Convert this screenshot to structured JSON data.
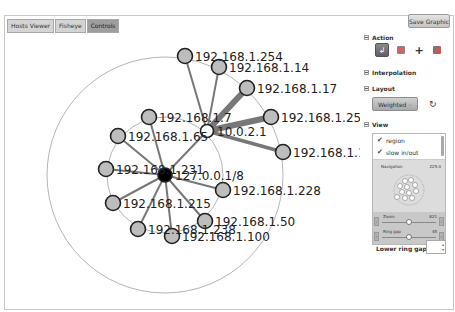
{
  "tabs": [
    {
      "label": "Hosts Viewer",
      "active": false
    },
    {
      "label": "Fisheye",
      "active": false
    },
    {
      "label": "Controls",
      "active": true
    }
  ],
  "toolbar": {
    "save_label": "Save Graphic"
  },
  "sidebar": {
    "action": {
      "label": "Action",
      "icons": [
        "pointer-icon",
        "image-icon",
        "move-icon",
        "zoom-region-icon"
      ],
      "selected": 0
    },
    "interpolation": {
      "label": "Interpolation"
    },
    "layout": {
      "label": "Layout",
      "selected": "Weighted",
      "refresh_icon": "refresh-icon"
    },
    "view": {
      "label": "View",
      "checkboxes": [
        {
          "label": "region",
          "checked": true
        },
        {
          "label": "slow in/out",
          "checked": true
        }
      ],
      "navigation": {
        "label": "Navigation",
        "value": "225.0"
      },
      "zoom": {
        "label": "Zoom",
        "value": "821",
        "fraction": 0.5
      },
      "ring_gap": {
        "label": "Ring gap",
        "value": "45",
        "fraction": 0.5
      }
    },
    "lower_ring_gap": {
      "label": "Lower ring gap",
      "value": ""
    }
  },
  "graph": {
    "center": {
      "id": "127.0.0.1/8",
      "color": "#000000"
    },
    "hub": {
      "id": "10.0.2.1",
      "color": "#ffffff"
    },
    "node_color": "#bdbdbd",
    "edge_color": "#777777",
    "nodes": [
      {
        "id": "192.168.1.254",
        "parent": "10.0.2.1",
        "weight": 1
      },
      {
        "id": "192.168.1.14",
        "parent": "10.0.2.1",
        "weight": 1
      },
      {
        "id": "192.168.1.17",
        "parent": "10.0.2.1",
        "weight": 3
      },
      {
        "id": "192.168.1.25",
        "parent": "10.0.2.1",
        "weight": 3
      },
      {
        "id": "192.168.1.1",
        "parent": "10.0.2.1",
        "weight": 2
      },
      {
        "id": "192.168.1.7",
        "parent": "127.0.0.1/8",
        "weight": 1
      },
      {
        "id": "192.168.1.65",
        "parent": "127.0.0.1/8",
        "weight": 1
      },
      {
        "id": "192.168.1.231",
        "parent": "127.0.0.1/8",
        "weight": 1
      },
      {
        "id": "192.168.1.215",
        "parent": "127.0.0.1/8",
        "weight": 1
      },
      {
        "id": "192.168.1.238",
        "parent": "127.0.0.1/8",
        "weight": 1
      },
      {
        "id": "192.168.1.100",
        "parent": "127.0.0.1/8",
        "weight": 1
      },
      {
        "id": "192.168.1.50",
        "parent": "127.0.0.1/8",
        "weight": 1
      },
      {
        "id": "192.168.1.228",
        "parent": "127.0.0.1/8",
        "weight": 1
      },
      {
        "id": "10.0.2.1",
        "parent": "127.0.0.1/8",
        "weight": 1
      }
    ]
  }
}
